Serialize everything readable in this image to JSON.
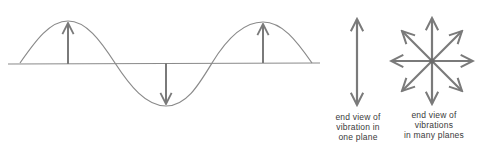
{
  "diagram": {
    "colors": {
      "line": "#8a8a8a",
      "arrow": "#7a7a7a",
      "text": "#3a3a3a",
      "background": "#ffffff"
    },
    "wave": {
      "type": "sine",
      "axis": {
        "x1": 8,
        "x2": 320,
        "y": 64
      },
      "vibration_arrows": [
        {
          "x": 68,
          "direction": "up"
        },
        {
          "x": 166,
          "direction": "down"
        },
        {
          "x": 263,
          "direction": "up"
        }
      ]
    },
    "single_plane": {
      "icon": "double-headed-vertical-arrow",
      "caption_lines": [
        "end view of",
        "vibration in",
        "one plane"
      ]
    },
    "many_planes": {
      "icon": "eight-direction-star-arrows",
      "caption_lines": [
        "end view of",
        "vibrations",
        "in many planes"
      ]
    }
  }
}
